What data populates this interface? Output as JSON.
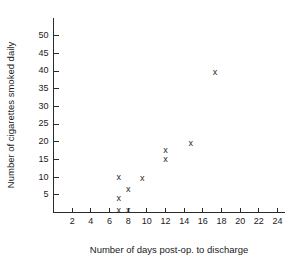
{
  "chart_data": {
    "type": "scatter",
    "title": "",
    "xlabel": "Number of days post-op. to discharge",
    "ylabel": "Number of cigarettes smoked daily",
    "marker": "x",
    "grid": false,
    "legend": "none",
    "xlim": [
      0,
      24.8
    ],
    "ylim": [
      0,
      55
    ],
    "xticks": [
      2,
      4,
      6,
      8,
      10,
      12,
      14,
      16,
      18,
      20,
      22,
      24
    ],
    "yticks": [
      5,
      10,
      15,
      20,
      25,
      30,
      35,
      40,
      45,
      50
    ],
    "xtick_labels": [
      "2",
      "4",
      "6",
      "8",
      "10",
      "12",
      "14",
      "16",
      "18",
      "20",
      "22",
      "24"
    ],
    "ytick_labels": [
      "5",
      "10",
      "15",
      "20",
      "25",
      "30",
      "35",
      "40",
      "45",
      "50"
    ],
    "points": [
      {
        "x": 7,
        "y": 10
      },
      {
        "x": 7,
        "y": 4
      },
      {
        "x": 7,
        "y": 0.5
      },
      {
        "x": 8,
        "y": 6.5
      },
      {
        "x": 8,
        "y": 0.5
      },
      {
        "x": 9.5,
        "y": 9.5
      },
      {
        "x": 12,
        "y": 17.5
      },
      {
        "x": 12,
        "y": 15
      },
      {
        "x": 14.7,
        "y": 19.5
      },
      {
        "x": 17.3,
        "y": 39.5
      }
    ],
    "colors": {
      "background": "#ffffff",
      "axis": "#2b2b2b",
      "marker": "#262626",
      "text": "#1a1a1a"
    }
  }
}
